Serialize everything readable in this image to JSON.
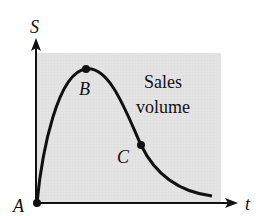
{
  "diagram": {
    "y_axis_label": "S",
    "x_axis_label": "t",
    "annotation_line1": "Sales",
    "annotation_line2": "volume",
    "points": [
      {
        "label": "A",
        "description": "origin"
      },
      {
        "label": "B",
        "description": "maximum"
      },
      {
        "label": "C",
        "description": "inflection point"
      }
    ],
    "colors": {
      "panel": "#e6e6e6",
      "curve": "#111111",
      "axes": "#111111"
    }
  }
}
